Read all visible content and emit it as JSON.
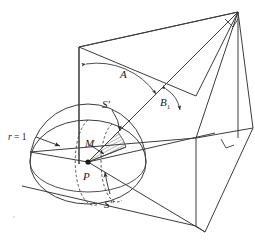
{
  "figure": {
    "background_color": "#ffffff",
    "line_color": "#3c3c3c",
    "label_color": "#1a1a1a",
    "width": 255,
    "height": 240
  },
  "labels": {
    "radius": "r = 1",
    "radius_value": "1",
    "radius_symbol": "r",
    "angle_a": "A",
    "angle_b1_base": "B",
    "angle_b1_subscript": "1",
    "point_p": "P",
    "point_m": "M",
    "surface_s_prime_base": "S",
    "surface_s_prime_mark": "′",
    "surface_s_double_prime_base": "S",
    "surface_s_double_prime_mark": "″"
  },
  "geometry": {
    "sphere_center": [
      88,
      162
    ],
    "sphere_radius_x": 58,
    "sphere_radius_y": 42,
    "apex": [
      238,
      12
    ],
    "fold_line_top": [
      196,
      138
    ],
    "fold_line_bottom": [
      196,
      226
    ],
    "right_angle_markers": 2,
    "hatch_lines": 11,
    "dashed_arcs": 2
  },
  "annotations": {
    "arrowheads": 8,
    "leader_lines": 4
  }
}
